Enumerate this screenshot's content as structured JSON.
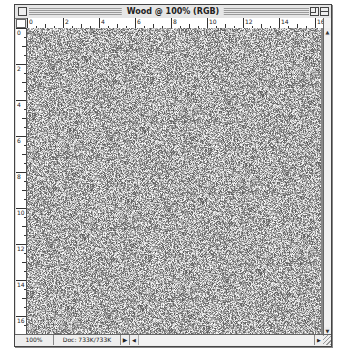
{
  "window": {
    "title": "Wood @ 100% (RGB)"
  },
  "rulers": {
    "horizontal_labels": [
      "0",
      "2",
      "4",
      "6",
      "8",
      "10",
      "12",
      "14",
      "16"
    ],
    "vertical_labels": [
      "0",
      "2",
      "4",
      "6",
      "8",
      "10",
      "12",
      "14",
      "16"
    ]
  },
  "canvas": {
    "content": "grayscale noise texture"
  },
  "statusbar": {
    "zoom": "100%",
    "doc_size": "Doc: 733K/733K",
    "menu_arrow": "▶"
  },
  "scroll": {
    "up_arrow": "▲",
    "down_arrow": "▼",
    "left_arrow": "◀",
    "right_arrow": "▶"
  }
}
